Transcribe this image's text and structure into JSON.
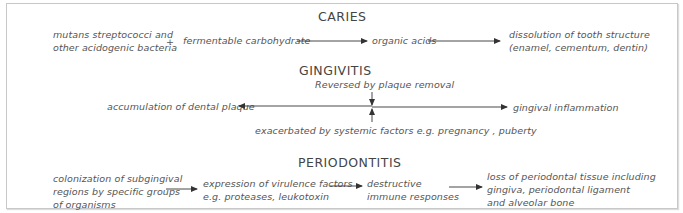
{
  "caries": {
    "title": "CARIES",
    "bacteria_line1": "mutans streptococci and",
    "bacteria_line2": "other acidogenic bacteria",
    "plus": "+",
    "carbohydrate": "fermentable carbohydrate",
    "acids": "organic acids",
    "result_line1": "dissolution of tooth structure",
    "result_line2": "(enamel, cementum, dentin)"
  },
  "gingivitis": {
    "title": "GINGIVITIS",
    "reversed": "Reversed by plaque removal",
    "left": "accumulation of dental plaque",
    "right": "gingival inflammation",
    "exacerbated": "exacerbated by systemic factors e.g. pregnancy , puberty"
  },
  "periodontitis": {
    "title": "PERIODONTITIS",
    "step1_line1": "colonization of subgingival",
    "step1_line2": "regions by specific groups",
    "step1_line3": "of organisms",
    "step2_line1": "expression of virulence factors",
    "step2_line2": "e.g. proteases, leukotoxin",
    "step3_line1": "destructive",
    "step3_line2": "immune responses",
    "step4_line1": "loss of periodontal tissue including",
    "step4_line2": "gingiva, periodontal ligament",
    "step4_line3": "and alveolar bone"
  },
  "colors": {
    "border": "#c8c8c8",
    "text": "#555555",
    "arrow": "#333333"
  }
}
